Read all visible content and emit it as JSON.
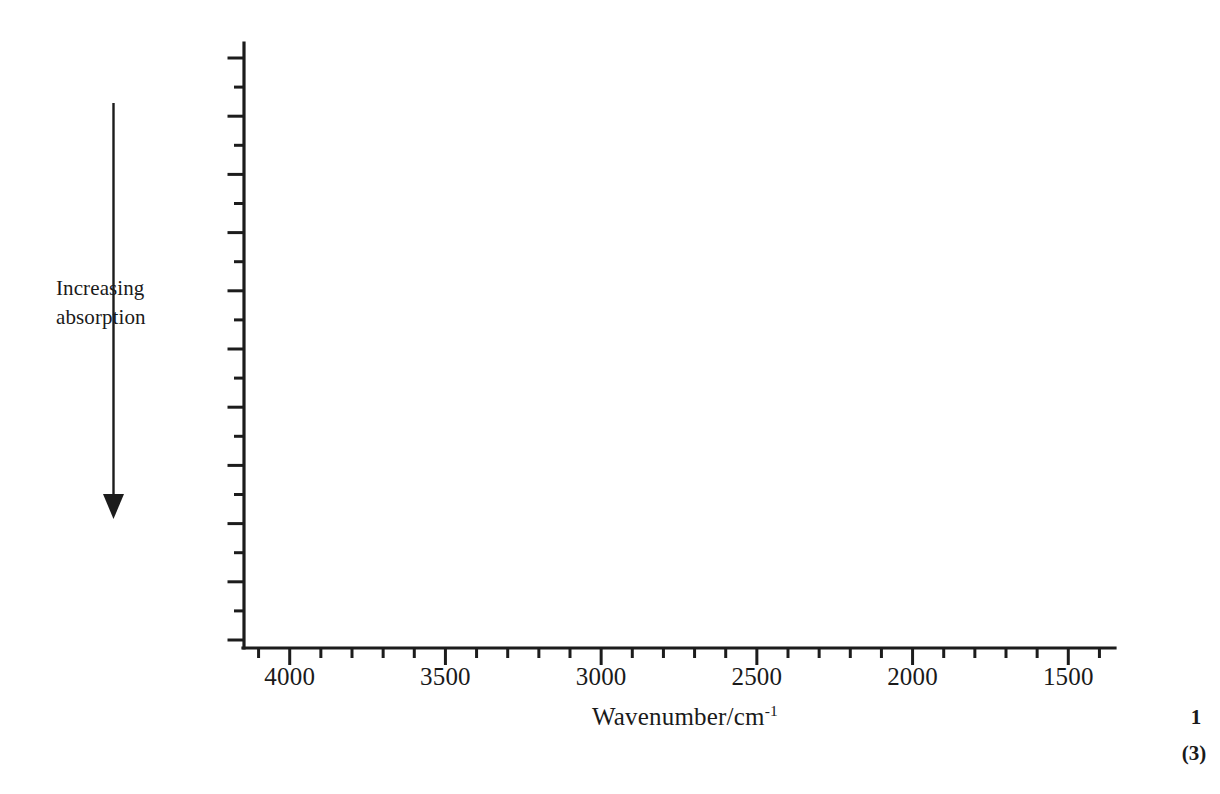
{
  "figure": {
    "kind": "blank-ir-spectrum-axes",
    "background_color": "#ffffff",
    "ink_color": "#1c1c1c"
  },
  "chart_data": {
    "type": "line",
    "title": "",
    "subtitle": "",
    "xlabel": "Wavenumber/cm",
    "xlabel_superscript": "-1",
    "ylabel_lines": [
      "Increasing",
      "absorption"
    ],
    "series": [
      {
        "name": "spectrum",
        "x": [],
        "y": []
      }
    ],
    "x": [],
    "values": [],
    "xlim": [
      4150,
      1350
    ],
    "x_direction": "decreasing",
    "xticks_major": [
      4000,
      3500,
      3000,
      2500,
      2000,
      1500
    ],
    "xtick_labels": [
      "4000",
      "3500",
      "3000",
      "2500",
      "2000",
      "1500"
    ],
    "x_minor_ticks_between_major": 4,
    "x_minor_interval": 100,
    "ylim": [
      0,
      1
    ],
    "yticks_major_count": 11,
    "yticks_minor_count": 10,
    "y_tick_labels": [],
    "grid": false,
    "legend": null,
    "legend_position": "none",
    "annotations": [
      {
        "name": "increasing-absorption-arrow",
        "text": "Increasing absorption",
        "direction": "down",
        "orientation": "vertical"
      }
    ]
  },
  "y_axis": {
    "title_lines": [
      "Increasing",
      "absorption"
    ],
    "arrow_direction": "down"
  },
  "x_axis": {
    "title_main": "Wavenumber/cm",
    "title_sup": "-1",
    "tick_labels": [
      "4000",
      "3500",
      "3000",
      "2500",
      "2000",
      "1500"
    ]
  },
  "page_marks": {
    "question_number": "1",
    "marks_available": "(3)"
  }
}
